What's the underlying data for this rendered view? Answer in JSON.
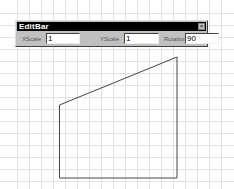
{
  "editbar": {
    "title": "EditBar",
    "close_icon": "close-icon",
    "fields": [
      {
        "label": "XScale",
        "value": "1"
      },
      {
        "label": "YScale",
        "value": "1"
      },
      {
        "label": "Rotation",
        "value": "90"
      }
    ]
  },
  "canvas": {
    "grid_spacing_px": 12,
    "grid_color": "#dcdcdc",
    "shape": {
      "type": "polygon",
      "points": [
        [
          59.5,
          105
        ],
        [
          177,
          57
        ],
        [
          177,
          178
        ],
        [
          59.5,
          178
        ]
      ],
      "stroke": "#444444"
    }
  }
}
